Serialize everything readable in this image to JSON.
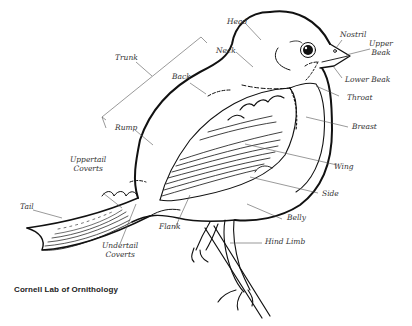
{
  "diagram": {
    "credit": "Cornell Lab of Ornithology",
    "line_color": "#111111",
    "leader_color": "#555555",
    "labels": [
      {
        "id": "head",
        "text": "Head"
      },
      {
        "id": "neck",
        "text": "Neck"
      },
      {
        "id": "nostril",
        "text": "Nostril"
      },
      {
        "id": "upper_beak",
        "text": "Upper Beak"
      },
      {
        "id": "lower_beak",
        "text": "Lower Beak"
      },
      {
        "id": "throat",
        "text": "Throat"
      },
      {
        "id": "breast",
        "text": "Breast"
      },
      {
        "id": "trunk",
        "text": "Trunk"
      },
      {
        "id": "back",
        "text": "Back"
      },
      {
        "id": "rump",
        "text": "Rump"
      },
      {
        "id": "uppertail_coverts",
        "text": "Uppertail Coverts"
      },
      {
        "id": "tail",
        "text": "Tail"
      },
      {
        "id": "undertail_coverts",
        "text": "Undertail Coverts"
      },
      {
        "id": "flank",
        "text": "Flank"
      },
      {
        "id": "wing",
        "text": "Wing"
      },
      {
        "id": "side",
        "text": "Side"
      },
      {
        "id": "belly",
        "text": "Belly"
      },
      {
        "id": "hind_limb",
        "text": "Hind Limb"
      }
    ]
  },
  "labels": {
    "head": "Head",
    "neck": "Neck",
    "nostril": "Nostril",
    "upper_beak_1": "Upper",
    "upper_beak_2": "Beak",
    "lower_beak": "Lower Beak",
    "throat": "Throat",
    "breast": "Breast",
    "trunk": "Trunk",
    "back": "Back",
    "rump": "Rump",
    "uppertail_1": "Uppertail",
    "uppertail_2": "Coverts",
    "tail": "Tail",
    "undertail_1": "Undertail",
    "undertail_2": "Coverts",
    "flank": "Flank",
    "wing": "Wing",
    "side": "Side",
    "belly": "Belly",
    "hind_limb": "Hind Limb"
  },
  "credit": "Cornell Lab of Ornithology"
}
